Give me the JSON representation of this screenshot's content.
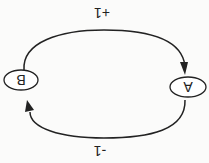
{
  "diagram": {
    "orientation": "rotated-180",
    "nodes": [
      {
        "id": "A",
        "label": "A"
      },
      {
        "id": "B",
        "label": "B"
      }
    ],
    "edges": [
      {
        "from": "B",
        "to": "A",
        "label": "+1"
      },
      {
        "from": "A",
        "to": "B",
        "label": "-1"
      }
    ],
    "colors": {
      "stroke": "#222222",
      "background": "#fbfbfa"
    }
  }
}
